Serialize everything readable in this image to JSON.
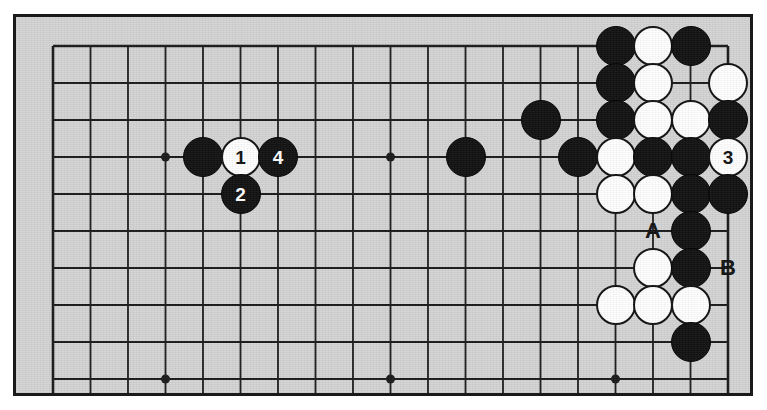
{
  "diagram": {
    "type": "go-board-diagram",
    "board_size": 19,
    "visible_region": {
      "columns": 19,
      "rows": 10,
      "description": "Upper portion of a 19x19 go board, cropped below row 10"
    },
    "colors": {
      "board": "#d4d4d4",
      "line": "#1a1a1a",
      "black_stone": "#111111",
      "white_stone": "#ffffff",
      "page_background": "#ffffff"
    },
    "geometry": {
      "origin_x": 37,
      "origin_y": 29,
      "col_spacing": 37.5,
      "row_spacing": 37,
      "stone_radius": 20
    },
    "star_points": [
      {
        "col": 4,
        "row": 4
      },
      {
        "col": 10,
        "row": 4
      },
      {
        "col": 16,
        "row": 4
      },
      {
        "col": 4,
        "row": 10
      },
      {
        "col": 10,
        "row": 10
      },
      {
        "col": 16,
        "row": 10
      }
    ],
    "stones": [
      {
        "col": 5,
        "row": 4,
        "color": "black",
        "label": ""
      },
      {
        "col": 6,
        "row": 4,
        "color": "white",
        "label": "1"
      },
      {
        "col": 7,
        "row": 4,
        "color": "black",
        "label": "4"
      },
      {
        "col": 6,
        "row": 5,
        "color": "black",
        "label": "2"
      },
      {
        "col": 12,
        "row": 4,
        "color": "black",
        "label": ""
      },
      {
        "col": 14,
        "row": 3,
        "color": "black",
        "label": ""
      },
      {
        "col": 15,
        "row": 4,
        "color": "black",
        "label": ""
      },
      {
        "col": 16,
        "row": 1,
        "color": "black",
        "label": ""
      },
      {
        "col": 17,
        "row": 1,
        "color": "white",
        "label": ""
      },
      {
        "col": 18,
        "row": 1,
        "color": "black",
        "label": ""
      },
      {
        "col": 16,
        "row": 2,
        "color": "black",
        "label": ""
      },
      {
        "col": 17,
        "row": 2,
        "color": "white",
        "label": ""
      },
      {
        "col": 19,
        "row": 2,
        "color": "white",
        "label": ""
      },
      {
        "col": 16,
        "row": 3,
        "color": "black",
        "label": ""
      },
      {
        "col": 17,
        "row": 3,
        "color": "white",
        "label": ""
      },
      {
        "col": 18,
        "row": 3,
        "color": "white",
        "label": ""
      },
      {
        "col": 19,
        "row": 3,
        "color": "black",
        "label": ""
      },
      {
        "col": 16,
        "row": 4,
        "color": "white",
        "label": ""
      },
      {
        "col": 17,
        "row": 4,
        "color": "black",
        "label": ""
      },
      {
        "col": 18,
        "row": 4,
        "color": "black",
        "label": ""
      },
      {
        "col": 19,
        "row": 4,
        "color": "white",
        "label": "3"
      },
      {
        "col": 16,
        "row": 5,
        "color": "white",
        "label": ""
      },
      {
        "col": 17,
        "row": 5,
        "color": "white",
        "label": ""
      },
      {
        "col": 18,
        "row": 5,
        "color": "black",
        "label": ""
      },
      {
        "col": 19,
        "row": 5,
        "color": "black",
        "label": ""
      },
      {
        "col": 18,
        "row": 6,
        "color": "black",
        "label": ""
      },
      {
        "col": 17,
        "row": 7,
        "color": "white",
        "label": ""
      },
      {
        "col": 18,
        "row": 7,
        "color": "black",
        "label": ""
      },
      {
        "col": 16,
        "row": 8,
        "color": "white",
        "label": ""
      },
      {
        "col": 17,
        "row": 8,
        "color": "white",
        "label": ""
      },
      {
        "col": 18,
        "row": 8,
        "color": "white",
        "label": ""
      },
      {
        "col": 18,
        "row": 9,
        "color": "black",
        "label": ""
      }
    ],
    "point_labels": [
      {
        "col": 17,
        "row": 6,
        "text": "A"
      },
      {
        "col": 19,
        "row": 7,
        "text": "B"
      }
    ],
    "move_numbers": [
      "1",
      "2",
      "3",
      "4"
    ],
    "annotation_letters": [
      "A",
      "B"
    ]
  }
}
